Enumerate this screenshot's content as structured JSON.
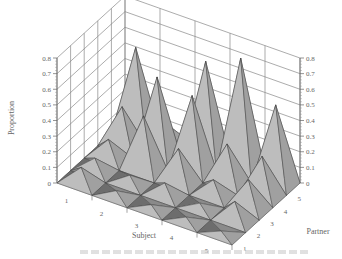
{
  "chart_data": {
    "type": "3d-bar",
    "title": "",
    "xlabel": "Subject",
    "ylabel": "Partner",
    "zlabel": "Proportion",
    "x_ticks": [
      "1",
      "2",
      "3",
      "4",
      "5"
    ],
    "y_ticks": [
      "1",
      "2",
      "3",
      "4",
      "5"
    ],
    "z_ticks": [
      "0",
      "0.1",
      "0.2",
      "0.3",
      "0.4",
      "0.5",
      "0.6",
      "0.7",
      "0.8"
    ],
    "zlim": [
      0,
      0.8
    ],
    "grid": true,
    "style": "pyramid peaks, grayscale shading",
    "series": [
      {
        "name": "Subject 1",
        "values": [
          0.1,
          0.08,
          0.12,
          0.25,
          0.55
        ]
      },
      {
        "name": "Subject 2",
        "values": [
          0.03,
          0.05,
          0.35,
          0.52,
          0.12
        ]
      },
      {
        "name": "Subject 3",
        "values": [
          0.02,
          0.08,
          0.22,
          0.48,
          0.62
        ]
      },
      {
        "name": "Subject 4",
        "values": [
          0.02,
          0.03,
          0.1,
          0.25,
          0.72
        ]
      },
      {
        "name": "Subject 5",
        "values": [
          0.01,
          0.12,
          0.18,
          0.25,
          0.5
        ]
      }
    ]
  },
  "labels": {
    "zlabel": "Proportion",
    "xlabel": "Subject",
    "ylabel": "Partner"
  }
}
